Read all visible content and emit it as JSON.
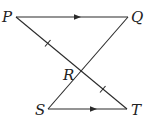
{
  "diagram": {
    "type": "geometry",
    "points": {
      "P": {
        "label": "P",
        "x": 16,
        "y": 17
      },
      "Q": {
        "label": "Q",
        "x": 128,
        "y": 17
      },
      "R": {
        "label": "R",
        "x": 80,
        "y": 70
      },
      "S": {
        "label": "S",
        "x": 48,
        "y": 109
      },
      "T": {
        "label": "T",
        "x": 127,
        "y": 109
      }
    },
    "segments": [
      {
        "from": "P",
        "to": "Q",
        "marking": "parallel-arrow"
      },
      {
        "from": "S",
        "to": "T",
        "marking": "parallel-arrow"
      },
      {
        "from": "P",
        "to": "T",
        "marking": "none"
      },
      {
        "from": "Q",
        "to": "S",
        "marking": "none"
      }
    ],
    "congruence_ticks": [
      {
        "segment": "PR",
        "count": 1
      },
      {
        "segment": "RT",
        "count": 1
      }
    ],
    "colors": {
      "line": "#2a2a2a",
      "label": "#222222",
      "background": "#ffffff"
    }
  },
  "labels": {
    "P": "P",
    "Q": "Q",
    "R": "R",
    "S": "S",
    "T": "T"
  }
}
